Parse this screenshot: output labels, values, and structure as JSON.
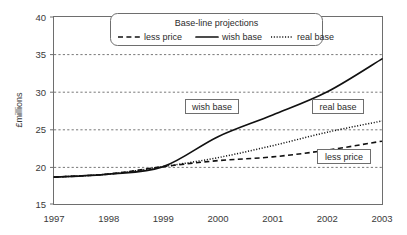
{
  "chart_data": {
    "type": "line",
    "title": "",
    "xlabel": "",
    "ylabel": "£millions",
    "xlim": [
      1997,
      2003
    ],
    "ylim": [
      15,
      40
    ],
    "grid": true,
    "gridlines_y": [
      20,
      25,
      30,
      35
    ],
    "legend_position": "top-center",
    "legend_title": "Base-line projections",
    "x_ticks": [
      "1997",
      "1998",
      "1999",
      "2000",
      "2001",
      "2002",
      "2003"
    ],
    "y_ticks": [
      "15",
      "20",
      "25",
      "30",
      "35",
      "40"
    ],
    "x": [
      1997,
      1998,
      1999,
      2000,
      2001,
      2002,
      2003
    ],
    "series": [
      {
        "name": "less price",
        "style": "dashed",
        "values": [
          18.6,
          19.0,
          20.0,
          20.8,
          21.3,
          22.2,
          23.4
        ]
      },
      {
        "name": "wish base",
        "style": "solid",
        "values": [
          18.6,
          19.0,
          20.0,
          24.0,
          26.9,
          30.0,
          34.4
        ]
      },
      {
        "name": "real base",
        "style": "dotted",
        "values": [
          18.6,
          19.0,
          20.0,
          21.2,
          22.8,
          24.6,
          26.1
        ]
      }
    ],
    "annotations": [
      {
        "text": "wish base",
        "x_px": 185,
        "y_px": 105
      },
      {
        "text": "real base",
        "x_px": 312,
        "y_px": 105
      },
      {
        "text": "less price",
        "x_px": 317,
        "y_px": 155
      }
    ]
  },
  "legend": {
    "title": "Base-line projections",
    "entries": [
      {
        "label": "less price",
        "style": "dashed"
      },
      {
        "label": "wish base",
        "style": "solid"
      },
      {
        "label": "real base",
        "style": "dotted"
      }
    ]
  },
  "axes": {
    "y_title": "£millions",
    "y_ticks": [
      "40",
      "35",
      "30",
      "25",
      "20",
      "15"
    ],
    "x_ticks": [
      "1997",
      "1998",
      "1999",
      "2000",
      "2001",
      "2002",
      "2003"
    ]
  }
}
